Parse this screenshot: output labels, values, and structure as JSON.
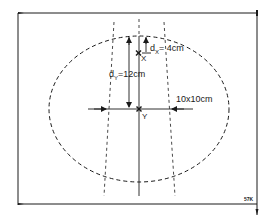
{
  "diagram": {
    "type": "phantom-beam-geometry",
    "colors": {
      "ink": "#1a1a1a",
      "background": "#ffffff"
    },
    "labels": {
      "dx": "dx = 4cm",
      "dx_base": "d",
      "dx_sub": "X",
      "dx_value": "= 4cm",
      "dy": "dY = 12cm",
      "dy_base": "d",
      "dy_sub": "Y",
      "dy_value": "=12cm",
      "field_size": "10x10cm",
      "point_x": "X",
      "point_y": "Y",
      "corner_code": "57K"
    },
    "points": [
      {
        "name": "X",
        "x": 139,
        "y": 53
      },
      {
        "name": "Y",
        "x": 139,
        "y": 109
      }
    ],
    "ellipse": {
      "cx": 139,
      "cy": 109,
      "rx": 90,
      "ry": 73,
      "style": "dashed"
    }
  }
}
